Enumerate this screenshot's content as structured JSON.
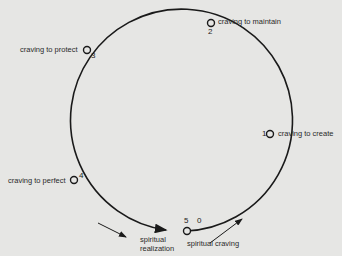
{
  "diagram": {
    "type": "cycle",
    "background": "#e6e6e4",
    "stroke_color": "#1a1a1a",
    "nodes": [
      {
        "id": "0",
        "number": "0",
        "label": "spiritual craving"
      },
      {
        "id": "1",
        "number": "1",
        "label": "craving to create"
      },
      {
        "id": "2",
        "number": "2",
        "label": "craving to maintain"
      },
      {
        "id": "3",
        "number": "3",
        "label": "craving to protect"
      },
      {
        "id": "4",
        "number": "4",
        "label": "craving to perfect"
      },
      {
        "id": "5",
        "number": "5",
        "label": "spiritual realization"
      }
    ],
    "labels": {
      "spiritual_realization_line1": "spiritual",
      "spiritual_realization_line2": "realization"
    }
  }
}
